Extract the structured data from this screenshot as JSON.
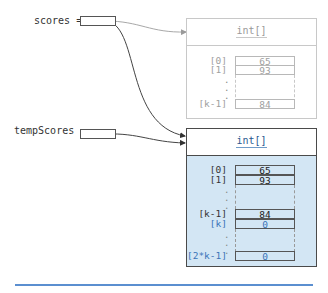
{
  "variables": [
    {
      "name": "scores",
      "label": "scores ="
    },
    {
      "name": "tempScores",
      "label": "tempScores ="
    }
  ],
  "old_array": {
    "type_label": "int[]",
    "rows": [
      {
        "index": "[0]",
        "value": "65"
      },
      {
        "index": "[1]",
        "value": "93"
      },
      {
        "index": "[k-1]",
        "value": "84"
      }
    ],
    "ellipsis": ".",
    "style": "faded"
  },
  "new_array": {
    "type_label": "int[]",
    "rows": [
      {
        "index": "[0]",
        "value": "65",
        "kind": "copied"
      },
      {
        "index": "[1]",
        "value": "93",
        "kind": "copied"
      },
      {
        "index": "[k-1]",
        "value": "84",
        "kind": "copied"
      },
      {
        "index": "[k]",
        "value": "0",
        "kind": "new"
      },
      {
        "index": "[2*k-1]",
        "value": "0",
        "kind": "new"
      }
    ],
    "ellipsis": "."
  },
  "colors": {
    "array_fill": "#d3e6f4",
    "new_index_text": "#3a74b8",
    "faded": "#a0a0a0",
    "rule": "#5b8fd0"
  }
}
